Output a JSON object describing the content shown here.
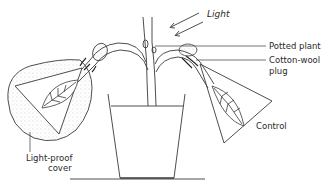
{
  "diagram": {
    "labels": {
      "light": "Light",
      "potted_plant": "Potted plant",
      "cotton_wool_plug_line1": "Cotton-wool",
      "cotton_wool_plug_line2": "plug",
      "control": "Control",
      "light_proof_cover_line1": "Light-proof",
      "light_proof_cover_line2": "cover"
    },
    "colors": {
      "stroke": "#3a3a3a",
      "background": "#ffffff",
      "stipple": "#9a9a9a"
    }
  }
}
